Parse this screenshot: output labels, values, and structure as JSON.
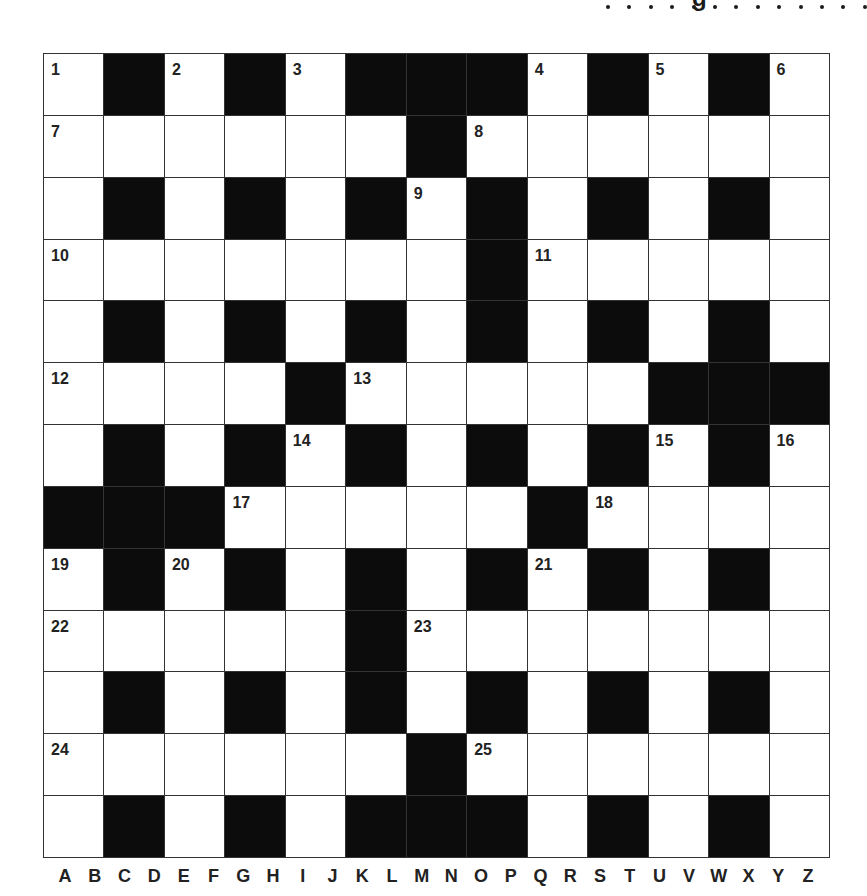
{
  "header": {
    "heading_fragment": "g",
    "dot_count": 13
  },
  "puzzle": {
    "rows": 13,
    "cols": 13,
    "grid": [
      "1B2B3BBB4B5B6",
      "7WWWWWB8WWWWW",
      "WBWBWB9BWBWBW",
      "10WWWWWWB11WWWW",
      "WBWBWBWBWBWBW",
      "12WWWB13WWWWBBB",
      "WBWB14BWBWB15B16",
      "BBB17WWWWB18WWW",
      "19B20BWBWB21BWBW",
      "22WWWWB23WWWWWW",
      "WBWBWBWBWBWBW",
      "24WWWWWB25WWWWW",
      "WBWBWBBBWBWBW"
    ],
    "cells": [
      [
        "1",
        "B",
        "2",
        "B",
        "3",
        "B",
        "B",
        "B",
        "4",
        "B",
        "5",
        "B",
        "6"
      ],
      [
        "7",
        "W",
        "W",
        "W",
        "W",
        "W",
        "B",
        "8",
        "W",
        "W",
        "W",
        "W",
        "W"
      ],
      [
        "W",
        "B",
        "W",
        "B",
        "W",
        "B",
        "9",
        "B",
        "W",
        "B",
        "W",
        "B",
        "W"
      ],
      [
        "10",
        "W",
        "W",
        "W",
        "W",
        "W",
        "W",
        "B",
        "11",
        "W",
        "W",
        "W",
        "W"
      ],
      [
        "W",
        "B",
        "W",
        "B",
        "W",
        "B",
        "W",
        "B",
        "W",
        "B",
        "W",
        "B",
        "W"
      ],
      [
        "12",
        "W",
        "W",
        "W",
        "B",
        "13",
        "W",
        "W",
        "W",
        "W",
        "B",
        "B",
        "B"
      ],
      [
        "W",
        "B",
        "W",
        "B",
        "14",
        "B",
        "W",
        "B",
        "W",
        "B",
        "15",
        "B",
        "16"
      ],
      [
        "B",
        "B",
        "B",
        "17",
        "W",
        "W",
        "W",
        "W",
        "B",
        "18",
        "W",
        "W",
        "W"
      ],
      [
        "19",
        "B",
        "20",
        "B",
        "W",
        "B",
        "W",
        "B",
        "21",
        "B",
        "W",
        "B",
        "W"
      ],
      [
        "22",
        "W",
        "W",
        "W",
        "W",
        "B",
        "23",
        "W",
        "W",
        "W",
        "W",
        "W",
        "W"
      ],
      [
        "W",
        "B",
        "W",
        "B",
        "W",
        "B",
        "W",
        "B",
        "W",
        "B",
        "W",
        "B",
        "W"
      ],
      [
        "24",
        "W",
        "W",
        "W",
        "W",
        "W",
        "B",
        "25",
        "W",
        "W",
        "W",
        "W",
        "W"
      ],
      [
        "W",
        "B",
        "W",
        "B",
        "W",
        "B",
        "B",
        "B",
        "W",
        "B",
        "W",
        "B",
        "W"
      ]
    ]
  },
  "column_letters": [
    "A",
    "B",
    "C",
    "D",
    "E",
    "F",
    "G",
    "H",
    "I",
    "J",
    "K",
    "L",
    "M",
    "N",
    "O",
    "P",
    "Q",
    "R",
    "S",
    "T",
    "U",
    "V",
    "W",
    "X",
    "Y",
    "Z"
  ],
  "colors": {
    "black_cell": "#0c0c0c",
    "white_cell": "#ffffff",
    "grid_line": "#333333",
    "text": "#222222"
  }
}
